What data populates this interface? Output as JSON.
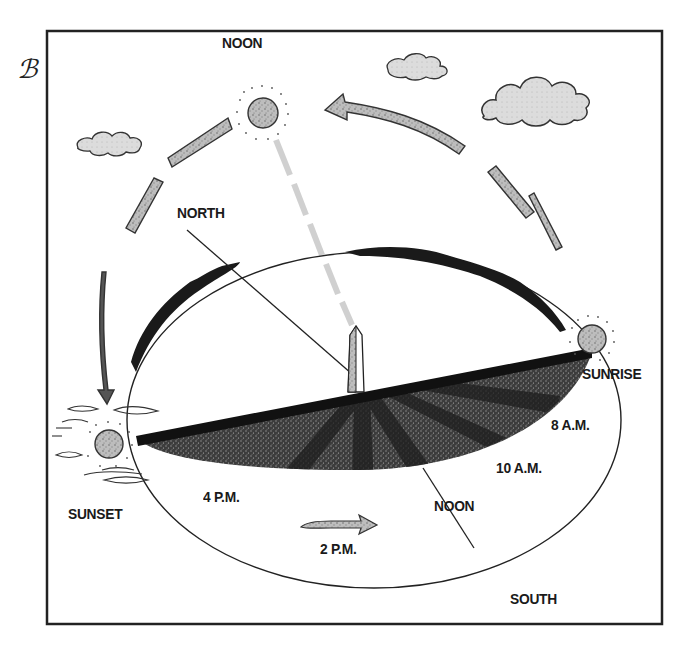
{
  "diagram": {
    "logo": "ℬ",
    "labels": {
      "noon_top": "NOON",
      "north": "NORTH",
      "sunrise": "SUNRISE",
      "sunset": "SUNSET",
      "eight_am": "8 A.M.",
      "ten_am": "10 A.M.",
      "noon_bottom": "NOON",
      "four_pm": "4 P.M.",
      "two_pm": "2 P.M.",
      "south": "SOUTH"
    },
    "colors": {
      "ink": "#1a1a1a",
      "ground_stipple": "#4a4a4a",
      "shadow": "#1e1e1e",
      "cloud_fill": "#d9d9d9",
      "arc_arrow_fill": "#b5b5b5",
      "sunbeam": "#d4d4d4",
      "frame": "#222222"
    }
  }
}
